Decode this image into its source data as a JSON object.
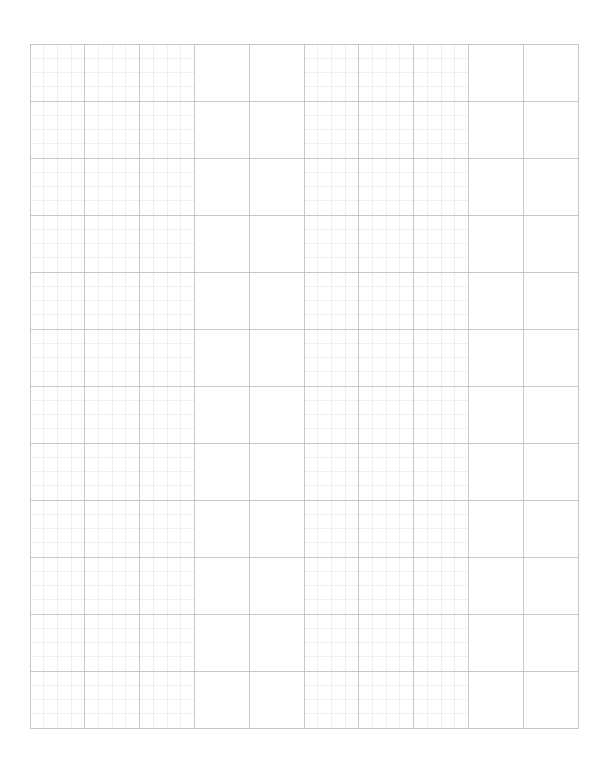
{
  "page": {
    "width": 607,
    "height": 763,
    "background_color": "#ffffff"
  },
  "grid": {
    "name": "graph-paper-grid",
    "origin_x": 30,
    "origin_y": 44,
    "width": 548,
    "height": 684,
    "major_cols": 10,
    "major_rows": 12,
    "major_cell_width": 54.8,
    "major_cell_height": 57.0,
    "minor_subdivisions": 4,
    "minor_cell_width": 13.7,
    "minor_cell_height": 14.25,
    "major_line_color": "#bbbbbb",
    "minor_line_color": "#e4e4e4",
    "border_color": "#c4c4c4",
    "major_line_width": 0.8,
    "minor_line_width": 0.6,
    "border_line_width": 0.9,
    "minor_col_bands": [
      {
        "name": "left-fine-band",
        "start_col": 0,
        "end_col": 3
      },
      {
        "name": "right-fine-band",
        "start_col": 5,
        "end_col": 8
      }
    ],
    "plain_col_bands": [
      {
        "name": "left-plain-gap",
        "start_col": 3,
        "end_col": 5
      },
      {
        "name": "right-plain-gap",
        "start_col": 8,
        "end_col": 10
      }
    ],
    "minor_row_bands": [
      {
        "name": "all-rows",
        "start_row": 0,
        "end_row": 12
      }
    ]
  },
  "chart_data": {
    "type": "table",
    "xlabel": "",
    "ylabel": "",
    "categories": [],
    "values": [],
    "grid": true,
    "legend": "none"
  }
}
